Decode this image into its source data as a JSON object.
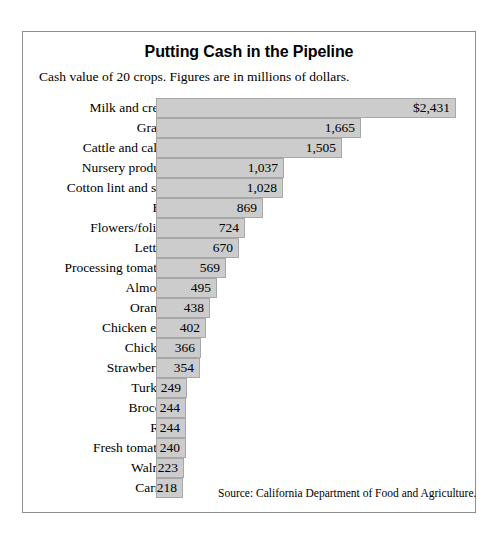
{
  "chart_data": {
    "type": "bar",
    "orientation": "horizontal",
    "title": "Putting Cash in the Pipeline",
    "subtitle": "Cash value of 20 crops. Figures are in millions of dollars.",
    "source": "Source: California Department of Food and Agriculture.",
    "xlabel": "",
    "ylabel": "",
    "xlim": [
      0,
      2431
    ],
    "grid": false,
    "legend": null,
    "units": "millions of dollars",
    "bar_color": "#cccccc",
    "bar_border_color": "#a8a8a8",
    "categories": [
      "Milk and cream",
      "Grapes",
      "Cattle and calves",
      "Nursery products",
      "Cotton lint and seed",
      "Hay",
      "Flowers/foliage",
      "Lettuce",
      "Processing tomatoes",
      "Almonds",
      "Oranges",
      "Chicken eggs",
      "Chickens",
      "Strawberries",
      "Turkeys",
      "Broccoli",
      "Rice",
      "Fresh tomatoes",
      "Walnuts",
      "Carrots"
    ],
    "values": [
      2431,
      1665,
      1505,
      1037,
      1028,
      869,
      724,
      670,
      569,
      495,
      438,
      402,
      366,
      354,
      249,
      244,
      244,
      240,
      223,
      218
    ],
    "value_labels": [
      "$2,431",
      "1,665",
      "1,505",
      "1,037",
      "1,028",
      "869",
      "724",
      "670",
      "569",
      "495",
      "438",
      "402",
      "366",
      "354",
      "249",
      "244",
      "244",
      "240",
      "223",
      "218"
    ]
  }
}
